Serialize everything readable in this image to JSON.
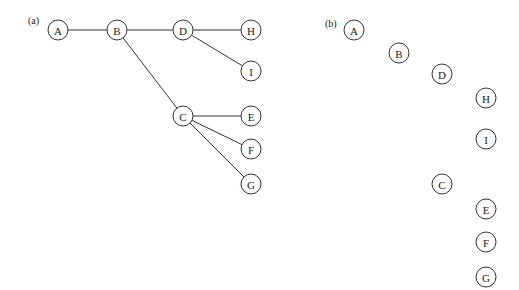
{
  "panels": [
    {
      "label": "(a)",
      "label_pos": [
        28,
        24
      ],
      "nodes": [
        {
          "id": "A",
          "x": 58,
          "y": 30
        },
        {
          "id": "B",
          "x": 117,
          "y": 30
        },
        {
          "id": "D",
          "x": 183,
          "y": 30
        },
        {
          "id": "H",
          "x": 251,
          "y": 30
        },
        {
          "id": "I",
          "x": 251,
          "y": 71
        },
        {
          "id": "C",
          "x": 183,
          "y": 116
        },
        {
          "id": "E",
          "x": 251,
          "y": 116
        },
        {
          "id": "F",
          "x": 251,
          "y": 149
        },
        {
          "id": "G",
          "x": 251,
          "y": 184
        }
      ],
      "edges": [
        [
          "A",
          "B"
        ],
        [
          "B",
          "D"
        ],
        [
          "D",
          "H"
        ],
        [
          "D",
          "I"
        ],
        [
          "B",
          "C"
        ],
        [
          "C",
          "E"
        ],
        [
          "C",
          "F"
        ],
        [
          "C",
          "G"
        ]
      ]
    },
    {
      "label": "(b)",
      "label_pos": [
        325,
        27
      ],
      "nodes": [
        {
          "id": "A",
          "x": 354,
          "y": 30
        },
        {
          "id": "B",
          "x": 399,
          "y": 53
        },
        {
          "id": "D",
          "x": 442,
          "y": 74
        },
        {
          "id": "H",
          "x": 486,
          "y": 98
        },
        {
          "id": "I",
          "x": 486,
          "y": 139
        },
        {
          "id": "C",
          "x": 442,
          "y": 184
        },
        {
          "id": "E",
          "x": 486,
          "y": 209
        },
        {
          "id": "F",
          "x": 486,
          "y": 242
        },
        {
          "id": "G",
          "x": 486,
          "y": 277
        }
      ],
      "edges": []
    }
  ],
  "node_radius": 10
}
